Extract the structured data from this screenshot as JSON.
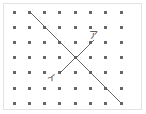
{
  "figure": {
    "kind": "dot-lattice-geometry-figure",
    "width": 146,
    "height": 114,
    "background_color": "#ffffff",
    "frame": {
      "border_color": "#e3e3e3",
      "x": 3,
      "y": 3,
      "width": 139,
      "height": 107
    },
    "grid": {
      "columns": 8,
      "rows": 7,
      "origin_x": 14,
      "origin_y": 12,
      "spacing_x": 15.3,
      "spacing_y": 15.2,
      "dot_color": "#666666",
      "dot_size": 3
    },
    "lines": [
      {
        "name": "descending-diagonal",
        "from_col": 1,
        "from_row": 0,
        "to_col": 7,
        "to_row": 6,
        "x1": 30,
        "y1": 12,
        "x2": 121,
        "y2": 103,
        "color": "#555555",
        "width": 0.9
      },
      {
        "name": "ascending-diagonal",
        "from_col": 3,
        "from_row": 4,
        "to_col": 5.2,
        "to_row": 1.9,
        "x1": 60,
        "y1": 73,
        "x2": 94,
        "y2": 40,
        "color": "#555555",
        "width": 0.9
      }
    ],
    "intersection": {
      "x": 76,
      "y": 58,
      "col": 4,
      "row": 3
    },
    "labels": [
      {
        "name": "label-a",
        "text": "ア",
        "x": 89,
        "y": 31,
        "color": "#3a3a3a",
        "font_size": 9
      },
      {
        "name": "label-i",
        "text": "イ",
        "x": 47,
        "y": 74,
        "color": "#3a3a3a",
        "font_size": 9
      }
    ]
  }
}
